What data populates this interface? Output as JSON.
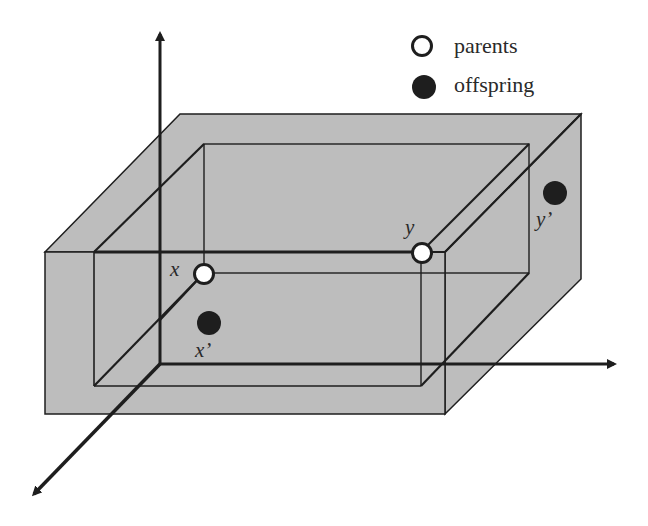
{
  "diagram": {
    "colors": {
      "box_fill": "#bdbdbd",
      "line": "#1e1e1e",
      "parent_fill": "#ffffff",
      "offspring_fill": "#1e1e1e"
    },
    "legend": {
      "parents_label": "parents",
      "offspring_label": "offspring"
    },
    "points": {
      "x_label": "x",
      "y_label": "y",
      "x_prime_label": "x’",
      "y_prime_label": "y’"
    },
    "axes": [
      "vertical-axis",
      "horizontal-axis",
      "depth-axis"
    ]
  }
}
